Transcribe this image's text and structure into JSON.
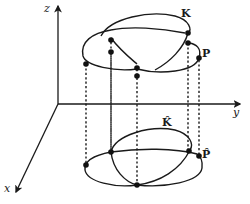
{
  "diagram": {
    "axes": {
      "z_label": "z",
      "y_label": "y",
      "x_label": "x"
    },
    "labels": {
      "knot": "K",
      "point": "P",
      "knot_projection": "K̂",
      "point_projection": "P̂"
    },
    "colors": {
      "stroke": "#1a1a1a",
      "background": "#ffffff"
    }
  }
}
